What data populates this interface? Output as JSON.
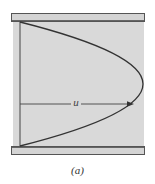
{
  "figure": {
    "caption": "(a)",
    "velocity_label": "u"
  },
  "colors": {
    "fluid_fill": "#d9d9d9",
    "plate_fill": "#d4d4d4",
    "plate_stroke": "#555555",
    "profile_stroke": "#333333",
    "arrow_stroke": "#444444"
  },
  "geometry": {
    "top_plate": {
      "x": 11,
      "y": 13,
      "width": 134,
      "height": 9
    },
    "bottom_plate": {
      "x": 11,
      "y": 146,
      "width": 134,
      "height": 9
    },
    "fluid_region": {
      "x": 13,
      "y": 22,
      "width": 131,
      "height": 124
    },
    "reference_axis_x": 20,
    "profile_vertex": {
      "x": 143,
      "y": 84
    },
    "arrow": {
      "x1": 20,
      "x2": 133,
      "y": 104
    }
  }
}
